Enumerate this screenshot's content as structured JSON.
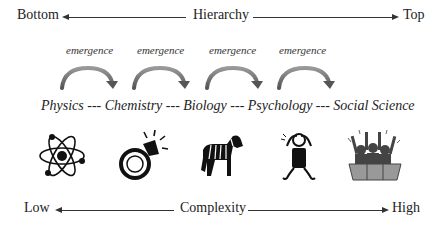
{
  "hierarchy_axis": {
    "left_label": "Bottom",
    "center_label": "Hierarchy",
    "right_label": "Top"
  },
  "emergence": {
    "labels": [
      "emergence",
      "emergence",
      "emergence",
      "emergence"
    ]
  },
  "disciplines": {
    "text": "Physics --- Chemistry --- Biology --- Psychology --- Social Science",
    "items": [
      "Physics",
      "Chemistry",
      "Biology",
      "Psychology",
      "Social Science"
    ]
  },
  "icons": [
    "atom-icon",
    "diamond-ring-icon",
    "zebra-icon",
    "stressed-person-icon",
    "cheering-crowd-icon"
  ],
  "complexity_axis": {
    "left_label": "Low",
    "center_label": "Complexity",
    "right_label": "High"
  }
}
